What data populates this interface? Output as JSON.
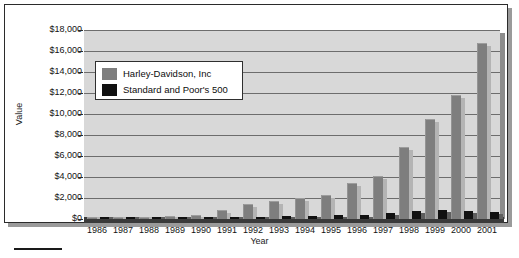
{
  "chart_data": {
    "type": "bar",
    "title": "",
    "xlabel": "Year",
    "ylabel": "Value",
    "ylim": [
      0,
      18000
    ],
    "ytick_values": [
      0,
      2000,
      4000,
      6000,
      8000,
      10000,
      12000,
      14000,
      16000,
      18000
    ],
    "ytick_labels": [
      "$0",
      "$2,000",
      "$4,000",
      "$6,000",
      "$8,000",
      "$10,000",
      "$12,000",
      "$14,000",
      "$16,000",
      "$18,000"
    ],
    "categories": [
      "1986",
      "1987",
      "1988",
      "1989",
      "1990",
      "1991",
      "1992",
      "1993",
      "1994",
      "1995",
      "1996",
      "1997",
      "1998",
      "1999",
      "2000",
      "2001"
    ],
    "grid": true,
    "legend_position": "upper-left-inside",
    "series": [
      {
        "name": "Harley-Davidson, Inc",
        "color": "#7e7e7e",
        "values": [
          100,
          150,
          230,
          330,
          370,
          900,
          1400,
          1700,
          2000,
          2300,
          3400,
          4100,
          6900,
          9500,
          11800,
          16800
        ]
      },
      {
        "name": "Standard and Poor's 500",
        "color": "#111111",
        "values": [
          100,
          110,
          125,
          160,
          160,
          210,
          225,
          250,
          250,
          340,
          420,
          560,
          720,
          870,
          790,
          700
        ]
      }
    ]
  },
  "axes": {
    "y_title": "Value",
    "x_title": "Year"
  },
  "legend": {
    "items": [
      {
        "label": "Harley-Davidson, Inc",
        "color": "#7e7e7e"
      },
      {
        "label": "Standard and Poor's 500",
        "color": "#111111"
      }
    ]
  }
}
